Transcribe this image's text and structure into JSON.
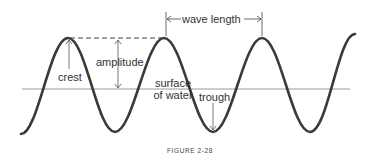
{
  "figure": {
    "caption": "FIGURE 2-28",
    "labels": {
      "wave_length": "wave length",
      "amplitude": "amplitude",
      "crest": "crest",
      "surface_line1": "surface",
      "surface_line2": "of water",
      "trough": "trough"
    },
    "colors": {
      "wave": "#3a3a3a",
      "water_line": "#999999",
      "annotation": "#555555",
      "text": "#333333"
    }
  }
}
